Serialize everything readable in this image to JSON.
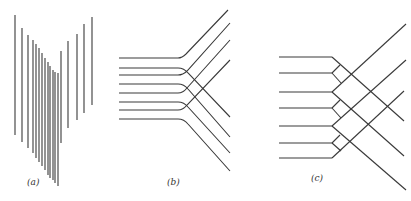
{
  "figure": {
    "stroke_color": "#3a3a3a",
    "background": "#ffffff",
    "stroke_width": 1.1
  },
  "panels": [
    {
      "id": "a",
      "label": "(a)",
      "description": "array of vertical line segments forming a V-shaped offset pattern",
      "lines": [
        [
          15,
          15,
          15,
          135
        ],
        [
          22,
          28,
          22,
          142
        ],
        [
          28,
          35,
          28,
          148
        ],
        [
          33,
          40,
          33,
          153
        ],
        [
          36,
          44,
          36,
          158
        ],
        [
          39,
          48,
          39,
          162
        ],
        [
          42,
          53,
          42,
          166
        ],
        [
          45,
          58,
          45,
          170
        ],
        [
          48,
          62,
          48,
          175
        ],
        [
          50,
          66,
          50,
          178
        ],
        [
          53,
          70,
          53,
          180
        ],
        [
          55,
          72,
          55,
          183
        ],
        [
          58,
          73,
          58,
          186
        ],
        [
          61,
          51,
          61,
          143
        ],
        [
          68,
          41,
          68,
          128
        ],
        [
          77,
          34,
          77,
          120
        ],
        [
          84,
          24,
          84,
          113
        ],
        [
          92,
          17,
          92,
          105
        ]
      ]
    },
    {
      "id": "b",
      "label": "(b)",
      "description": "eight horizontal lines bending alternately up-right and down-right with rounded corners",
      "paths": [
        "M119,58 L178,58 Q182,58 186,54 L228,10",
        "M119,68 L178,68 Q184,68 188,73 L230,117",
        "M119,75 L178,75 Q183,75 187,71 L230,23",
        "M119,84 L178,84 Q184,84 188,89 L230,137",
        "M119,93 L178,93 Q183,93 187,88 L230,40",
        "M119,102 L178,102 Q184,102 188,107 L230,153",
        "M119,110 L178,110 Q183,110 187,105 L230,60",
        "M119,119 L178,119 Q184,119 188,124 L230,171"
      ]
    },
    {
      "id": "c",
      "label": "(c)",
      "description": "seven horizontal lines meeting a lattice of crossing diagonals with small diamond junctions",
      "horizontals": [
        [
          279,
          57,
          332,
          57
        ],
        [
          279,
          73,
          332,
          73
        ],
        [
          279,
          92,
          332,
          92
        ],
        [
          279,
          108,
          332,
          108
        ],
        [
          279,
          126,
          332,
          126
        ],
        [
          279,
          143,
          332,
          143
        ],
        [
          279,
          158,
          332,
          158
        ]
      ],
      "diagonals": [
        [
          332,
          57,
          404,
          121
        ],
        [
          332,
          92,
          404,
          156
        ],
        [
          332,
          126,
          406,
          190
        ],
        [
          332,
          92,
          406,
          24
        ],
        [
          332,
          126,
          406,
          60
        ],
        [
          332,
          158,
          404,
          91
        ]
      ],
      "diamonds": [
        [
          332,
          73,
          340,
          65
        ],
        [
          332,
          73,
          341,
          83
        ],
        [
          332,
          108,
          340,
          100
        ],
        [
          332,
          108,
          341,
          118
        ],
        [
          332,
          143,
          340,
          135
        ],
        [
          332,
          143,
          341,
          151
        ]
      ]
    }
  ]
}
